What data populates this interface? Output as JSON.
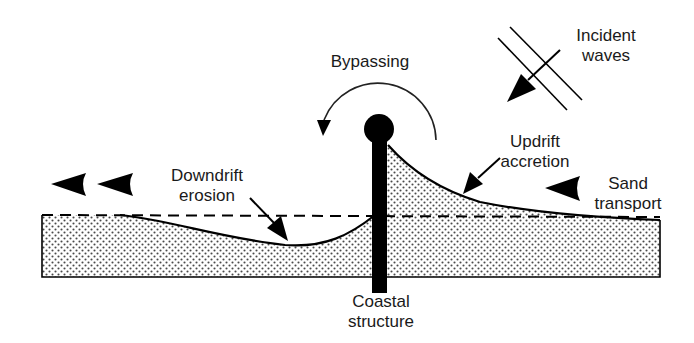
{
  "diagram": {
    "labels": {
      "incident_waves": [
        "Incident",
        "waves"
      ],
      "bypassing": "Bypassing",
      "updrift_accretion": [
        "Updrift",
        "accretion"
      ],
      "downdrift_erosion": [
        "Downdrift",
        "erosion"
      ],
      "sand_transport": [
        "Sand",
        "transport"
      ],
      "coastal_structure": [
        "Coastal",
        "structure"
      ]
    },
    "colors": {
      "ink": "#000000",
      "text": "#1a1a1a",
      "sand_dot": "#555555",
      "background": "#ffffff"
    },
    "elements": [
      {
        "name": "sand-body",
        "shape": "stippled-region"
      },
      {
        "name": "original-shoreline",
        "shape": "dashed-line"
      },
      {
        "name": "coastal-structure",
        "shape": "vertical-bar-with-ball"
      },
      {
        "name": "bypassing-arrow",
        "shape": "curved-arrow"
      },
      {
        "name": "incident-waves",
        "shape": "parallel-lines-with-arrow"
      },
      {
        "name": "sand-transport-arrows",
        "count": 3,
        "direction": "left"
      }
    ]
  }
}
